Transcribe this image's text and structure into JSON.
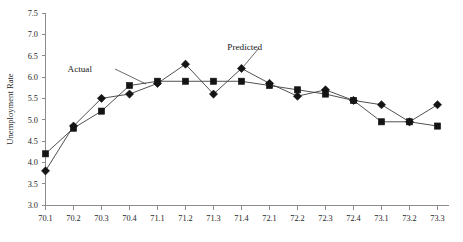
{
  "chart_data": {
    "type": "line",
    "title": "",
    "xlabel": "",
    "ylabel": "Unemployment Rate",
    "ylim": [
      3.0,
      7.5
    ],
    "ytick_labels": [
      "3.0",
      "3.5",
      "4.0",
      "4.5",
      "5.0",
      "5.5",
      "6.0",
      "6.5",
      "7.0",
      "7.5"
    ],
    "ytick_values": [
      3.0,
      3.5,
      4.0,
      4.5,
      5.0,
      5.5,
      6.0,
      6.5,
      7.0,
      7.5
    ],
    "grid": false,
    "legend_position": "inline-annotations",
    "categories": [
      "70.1",
      "70.2",
      "70.3",
      "70.4",
      "71.1",
      "71.2",
      "71.3",
      "71.4",
      "72.1",
      "72.2",
      "72.3",
      "72.4",
      "73.1",
      "73.2",
      "73.3"
    ],
    "series": [
      {
        "name": "Actual",
        "marker": "diamond",
        "values": [
          3.8,
          4.85,
          5.5,
          5.6,
          5.85,
          6.3,
          5.6,
          6.2,
          5.85,
          5.55,
          5.7,
          5.45,
          5.35,
          4.95,
          5.35
        ]
      },
      {
        "name": "Predicted",
        "marker": "square",
        "values": [
          4.2,
          4.8,
          5.2,
          5.8,
          5.9,
          5.9,
          5.9,
          5.9,
          5.8,
          5.7,
          5.6,
          5.45,
          4.95,
          4.95,
          4.85
        ]
      }
    ],
    "annotations": [
      {
        "text": "Actual",
        "label_x": 92,
        "label_y": 72,
        "leader_from_x": 115,
        "leader_from_y": 69,
        "leader_to_x": 146,
        "leader_to_y": 84
      },
      {
        "text": "Predicted",
        "label_x": 262,
        "label_y": 50,
        "leader_from_x": 259,
        "leader_from_y": 48,
        "leader_to_x": 243,
        "leader_to_y": 67
      }
    ]
  },
  "colors": {
    "marker": "#141414",
    "line": "#3d3d3d",
    "axis": "#8c8c8c",
    "text": "#1a1a1a",
    "background": "#ffffff"
  }
}
